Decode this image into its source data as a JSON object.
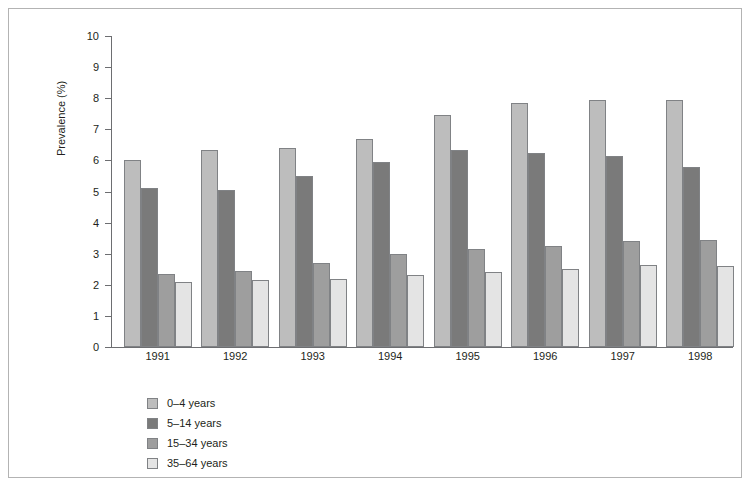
{
  "figure": {
    "border_color": "#b3b3b3",
    "background": "#ffffff"
  },
  "chart_data": {
    "type": "bar",
    "title": "",
    "xlabel": "",
    "ylabel": "Prevalence (%)",
    "ylim": [
      0,
      10
    ],
    "ytick_step": 1,
    "yticks": [
      "10",
      "9",
      "8",
      "7",
      "6",
      "5",
      "4",
      "3",
      "2",
      "1",
      "0"
    ],
    "categories": [
      "1991",
      "1992",
      "1993",
      "1994",
      "1995",
      "1996",
      "1997",
      "1998"
    ],
    "grid": false,
    "legend_position": "below-left",
    "series": [
      {
        "name": "0–4 years",
        "color": "#bdbdbd",
        "values": [
          6.0,
          6.35,
          6.4,
          6.7,
          7.45,
          7.85,
          7.95,
          7.95
        ]
      },
      {
        "name": "5–14 years",
        "color": "#7a7a7a",
        "values": [
          5.1,
          5.05,
          5.5,
          5.95,
          6.35,
          6.25,
          6.15,
          5.8
        ]
      },
      {
        "name": "15–34 years",
        "color": "#9e9e9e",
        "values": [
          2.35,
          2.45,
          2.7,
          3.0,
          3.15,
          3.25,
          3.4,
          3.45
        ]
      },
      {
        "name": "35–64 years",
        "color": "#e4e4e4",
        "values": [
          2.1,
          2.15,
          2.2,
          2.3,
          2.4,
          2.5,
          2.65,
          2.6
        ]
      }
    ]
  }
}
